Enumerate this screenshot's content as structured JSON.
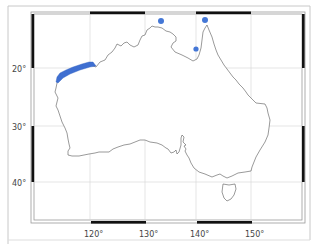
{
  "map": {
    "region": "Australia",
    "projection": "lon/lat",
    "lon_ticks": [
      {
        "value": 120,
        "label": "120°",
        "x": 90
      },
      {
        "value": 130,
        "label": "130°",
        "x": 145
      },
      {
        "value": 140,
        "label": "140°",
        "x": 196
      },
      {
        "value": 150,
        "label": "150°",
        "x": 251
      }
    ],
    "lat_ticks": [
      {
        "value": -20,
        "label": "20°",
        "y": 68
      },
      {
        "value": -30,
        "label": "30°",
        "y": 126
      },
      {
        "value": -40,
        "label": "40°",
        "y": 182
      }
    ],
    "colors": {
      "highlight": "#3f6fd1",
      "coast": "#555555",
      "grid": "#cfcfcf",
      "frame": "#111111",
      "outer_border": "#bdbdbd"
    },
    "highlighted_areas": [
      {
        "type": "region",
        "name": "northwest-coast-band",
        "description": "Pilbara/Ningaloo coastal band"
      }
    ],
    "points": [
      {
        "name": "point-arnhem",
        "x": 161,
        "y": 21
      },
      {
        "name": "point-cape-york",
        "x": 205,
        "y": 20
      },
      {
        "name": "point-gulf-carpentaria",
        "x": 196,
        "y": 49
      }
    ]
  }
}
